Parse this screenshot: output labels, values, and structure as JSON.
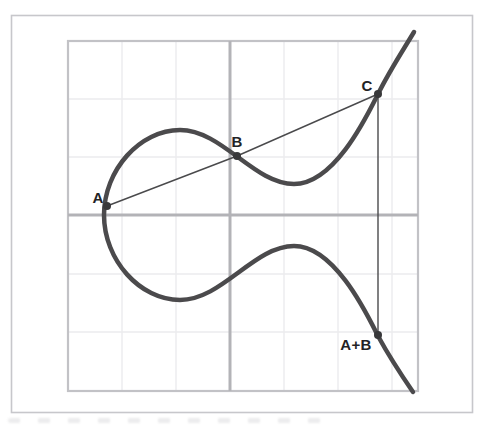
{
  "figure": {
    "name": "elliptic-curve-point-addition",
    "canvas": {
      "width": 482,
      "height": 427,
      "background": "#ffffff"
    },
    "frame": {
      "x": 11.5,
      "y": 15.5,
      "width": 461,
      "height": 397,
      "stroke": "#c7c7cb",
      "stroke_width": 1.6,
      "fill": "#ffffff"
    },
    "grid": {
      "x0": 68,
      "y0": 41,
      "x1": 418,
      "y1": 391,
      "v_lines": [
        122,
        176,
        284,
        338,
        392
      ],
      "h_lines": [
        99,
        157,
        274,
        332
      ],
      "axis_x": 230,
      "axis_y": 215,
      "edge_color": "#c2c2c6",
      "edge_width": 2.2,
      "line_color": "#ebebee",
      "line_width": 1.4,
      "axis_color": "#b3b3b7",
      "axis_width": 3
    },
    "curve": {
      "color": "#4b4a4c",
      "width": 4.5,
      "path": "M 414 32 C 402 52 390 70 378 94 C 366 118 334 184 294 184 C 254 184 222 130 180 130 C 140 130 104 170 104 215 C 104 260 140 300 180 300 C 222 300 254 246 294 246 C 334 246 366 312 378 336 C 390 358 402 376 413 392"
    },
    "secant_line": {
      "through": [
        "A",
        "B",
        "C"
      ],
      "color": "#4a4a4c",
      "width": 1.4
    },
    "vertical_line": {
      "from": "C",
      "to": "A+B",
      "color": "#4a4a4c",
      "width": 1.4
    },
    "point_style": {
      "radius": 4,
      "color": "#38383a"
    },
    "label_color": "#232325",
    "points": [
      {
        "name": "A",
        "label": "A",
        "x": 107,
        "y": 206,
        "label_x": 98,
        "label_y": 203
      },
      {
        "name": "B",
        "label": "B",
        "x": 237,
        "y": 156,
        "label_x": 237,
        "label_y": 147
      },
      {
        "name": "C",
        "label": "C",
        "x": 378,
        "y": 94,
        "label_x": 367,
        "label_y": 91
      },
      {
        "name": "A+B",
        "label": "A+B",
        "x": 378,
        "y": 335,
        "label_x": 356,
        "label_y": 350
      }
    ]
  }
}
